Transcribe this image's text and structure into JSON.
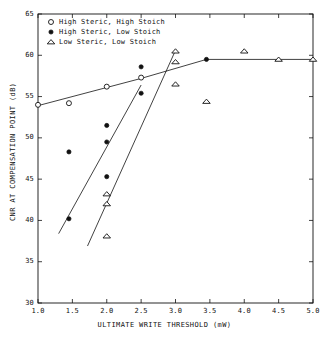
{
  "chart_data": {
    "type": "scatter",
    "title": "",
    "xlabel": "ULTIMATE WRITE THRESHOLD (mW)",
    "ylabel": "CNR AT COMPENSATION POINT (dB)",
    "xlim": [
      1.0,
      5.0
    ],
    "ylim": [
      30,
      65
    ],
    "xticks": [
      "1.0",
      "1.5",
      "2.0",
      "2.5",
      "3.0",
      "3.5",
      "4.0",
      "4.5",
      "5.0"
    ],
    "xtickvals": [
      1.0,
      1.5,
      2.0,
      2.5,
      3.0,
      3.5,
      4.0,
      4.5,
      5.0
    ],
    "yticks": [
      "30",
      "35",
      "40",
      "45",
      "50",
      "55",
      "60",
      "65"
    ],
    "ytickvals": [
      30,
      35,
      40,
      45,
      50,
      55,
      60,
      65
    ],
    "grid": false,
    "legend_position": "top-left",
    "series": [
      {
        "name": "High Steric, High Stoich",
        "marker": "open-circle",
        "points": [
          {
            "x": 1.0,
            "y": 54.0
          },
          {
            "x": 1.45,
            "y": 54.2
          },
          {
            "x": 2.0,
            "y": 56.2
          },
          {
            "x": 2.5,
            "y": 57.3
          }
        ],
        "fit_line": [
          {
            "x": 1.0,
            "y": 53.9
          },
          {
            "x": 2.5,
            "y": 57.2
          },
          {
            "x": 3.45,
            "y": 59.5
          },
          {
            "x": 5.0,
            "y": 59.5
          }
        ]
      },
      {
        "name": "High Steric, Low Stoich",
        "marker": "filled-circle",
        "points": [
          {
            "x": 1.45,
            "y": 40.2
          },
          {
            "x": 1.45,
            "y": 48.3
          },
          {
            "x": 2.0,
            "y": 45.3
          },
          {
            "x": 2.0,
            "y": 49.5
          },
          {
            "x": 2.0,
            "y": 51.5
          },
          {
            "x": 2.5,
            "y": 55.4
          },
          {
            "x": 2.5,
            "y": 58.6
          },
          {
            "x": 3.45,
            "y": 59.5
          }
        ],
        "fit_line": [
          {
            "x": 1.3,
            "y": 38.4
          },
          {
            "x": 2.5,
            "y": 56.4
          }
        ]
      },
      {
        "name": "Low Steric, Low Stoich",
        "marker": "open-triangle",
        "points": [
          {
            "x": 2.0,
            "y": 38.1
          },
          {
            "x": 2.0,
            "y": 42.0
          },
          {
            "x": 2.0,
            "y": 43.2
          },
          {
            "x": 3.0,
            "y": 56.5
          },
          {
            "x": 3.0,
            "y": 59.2
          },
          {
            "x": 3.0,
            "y": 60.5
          },
          {
            "x": 3.45,
            "y": 54.4
          },
          {
            "x": 4.0,
            "y": 60.5
          },
          {
            "x": 4.5,
            "y": 59.5
          },
          {
            "x": 5.0,
            "y": 59.5
          }
        ],
        "fit_line": [
          {
            "x": 1.72,
            "y": 36.9
          },
          {
            "x": 3.0,
            "y": 60.6
          }
        ]
      }
    ]
  },
  "legend": {
    "entries": [
      {
        "symbol": "open-circle",
        "label": "High Steric, High Stoich"
      },
      {
        "symbol": "filled-circle",
        "label": "High Steric, Low Stoich"
      },
      {
        "symbol": "open-triangle",
        "label": "Low Steric, Low Stoich"
      }
    ]
  },
  "axes": {
    "x_title": "ULTIMATE WRITE THRESHOLD (mW)",
    "y_title": "CNR AT COMPENSATION POINT (dB)"
  }
}
